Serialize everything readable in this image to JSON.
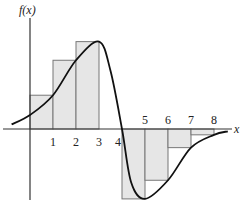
{
  "figure": {
    "y_axis_label": "f(x)",
    "x_axis_label": "x",
    "tick_labels": [
      "1",
      "2",
      "3",
      "4",
      "5",
      "6",
      "7",
      "8"
    ],
    "colors": {
      "rect_fill": "#e6e6e6",
      "rect_stroke": "#777777",
      "curve": "#111111",
      "axis": "#333333"
    }
  },
  "chart_data": {
    "type": "line",
    "title": "",
    "xlabel": "x",
    "ylabel": "f(x)",
    "x_ticks": [
      1,
      2,
      3,
      4,
      5,
      6,
      7,
      8
    ],
    "rectangles": [
      {
        "from": 0,
        "to": 1,
        "height": 1.45
      },
      {
        "from": 1,
        "to": 2,
        "height": 2.95
      },
      {
        "from": 2,
        "to": 3,
        "height": 3.75
      },
      {
        "from": 3,
        "to": 4,
        "height": 0
      },
      {
        "from": 4,
        "to": 5,
        "height": -3.0
      },
      {
        "from": 5,
        "to": 6,
        "height": -2.2
      },
      {
        "from": 6,
        "to": 7,
        "height": -0.8
      },
      {
        "from": 7,
        "to": 8,
        "height": -0.25
      }
    ],
    "curve_points": [
      [
        -0.8,
        0.2
      ],
      [
        0,
        0.6
      ],
      [
        1,
        1.45
      ],
      [
        2,
        2.95
      ],
      [
        3,
        3.75
      ],
      [
        3.5,
        2.5
      ],
      [
        4,
        0
      ],
      [
        4.4,
        -2.3
      ],
      [
        5,
        -3.0
      ],
      [
        6,
        -2.2
      ],
      [
        7,
        -0.8
      ],
      [
        8,
        -0.25
      ],
      [
        8.6,
        -0.1
      ]
    ],
    "grid": false,
    "legend": null
  }
}
